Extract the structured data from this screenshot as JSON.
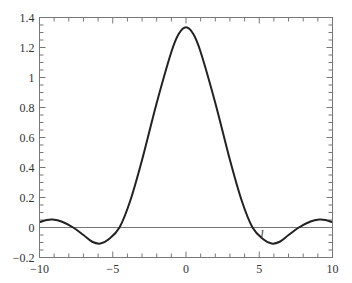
{
  "chart_data": {
    "type": "line",
    "title": "",
    "xlabel": "",
    "ylabel": "",
    "xlim": [
      -10,
      10
    ],
    "ylim": [
      -0.2,
      1.4
    ],
    "grid": false,
    "legend": null,
    "x_ticks": [
      "-10",
      "-5",
      "0",
      "5",
      "10"
    ],
    "y_ticks": [
      "-0.2",
      "0",
      "0.2",
      "0.4",
      "0.6",
      "0.8",
      "1",
      "1.2",
      "1.4"
    ],
    "reference_line": {
      "y": 0
    },
    "annotations": [
      {
        "text": "l",
        "x": 5.0,
        "y": -0.02
      }
    ],
    "series": [
      {
        "name": "f(x)",
        "color": "#222222",
        "x": [
          -10,
          -9.5,
          -9.1,
          -8.5,
          -7.7,
          -7.0,
          -6.4,
          -5.84,
          -5.3,
          -4.54,
          -3.8,
          -3.0,
          -2.0,
          -1.0,
          -0.5,
          0,
          0.5,
          1.0,
          2.0,
          3.0,
          3.8,
          4.54,
          5.3,
          5.84,
          6.4,
          7.0,
          7.7,
          8.5,
          9.1,
          9.5,
          10
        ],
        "y": [
          0.035,
          0.05,
          0.053,
          0.04,
          0.0,
          -0.05,
          -0.095,
          -0.107,
          -0.08,
          0.0,
          0.18,
          0.45,
          0.83,
          1.17,
          1.29,
          1.335,
          1.29,
          1.17,
          0.83,
          0.45,
          0.18,
          0.0,
          -0.08,
          -0.107,
          -0.095,
          -0.05,
          0.0,
          0.04,
          0.053,
          0.05,
          0.035
        ]
      }
    ]
  }
}
